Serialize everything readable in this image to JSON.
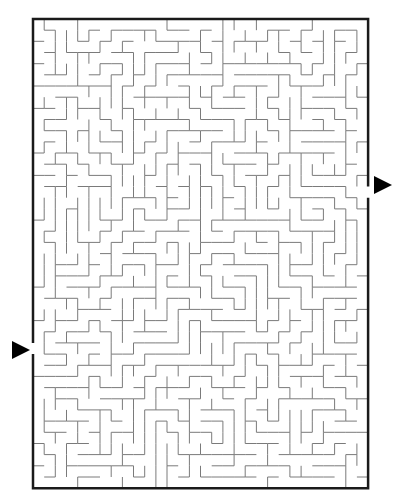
{
  "maze": {
    "cols": 30,
    "rows": 42,
    "origin": {
      "x": 33,
      "y": 19
    },
    "cell_size": 11.17,
    "seed": 7321,
    "wall_color": "#7a7a7a",
    "border_color": "#1a1a1a",
    "entrance": {
      "side": "left",
      "row": 29,
      "arrow": "right-pointing-triangle"
    },
    "exit": {
      "side": "right",
      "row": 15,
      "arrow": "right-pointing-triangle"
    }
  }
}
